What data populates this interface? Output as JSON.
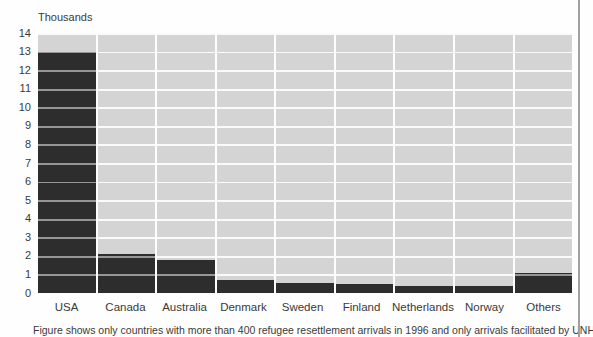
{
  "chart_data": {
    "type": "bar",
    "title": "",
    "ylabel": "Thousands",
    "xlabel": "",
    "categories": [
      "USA",
      "Canada",
      "Australia",
      "Denmark",
      "Sweden",
      "Finland",
      "Netherlands",
      "Norway",
      "Others"
    ],
    "values": [
      13.0,
      2.1,
      1.8,
      0.7,
      0.55,
      0.5,
      0.4,
      0.4,
      1.1
    ],
    "ylim": [
      0,
      14
    ],
    "yticks": [
      0,
      1,
      2,
      3,
      4,
      5,
      6,
      7,
      8,
      9,
      10,
      11,
      12,
      13,
      14
    ],
    "grid": "horizontal",
    "legend_position": "none",
    "series_name": "Refugee resettlement arrivals in 1996 (thousands)"
  },
  "caption": "Figure shows only countries with more than 400 refugee resettlement arrivals in 1996 and only arrivals facilitated by UNHCR",
  "colors": {
    "bar": "#2d2d2d",
    "plot_background": "#d4d4d4",
    "gridline": "#fafafa",
    "text": "#3a3a3a",
    "frame_line": "#a0a0a0",
    "page_background": "#fefefe"
  }
}
